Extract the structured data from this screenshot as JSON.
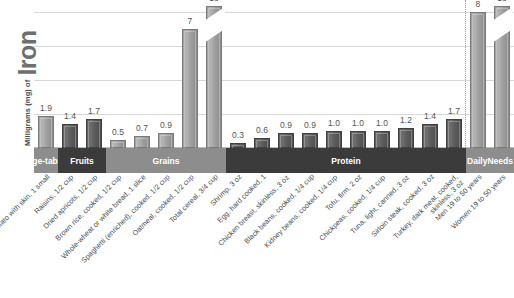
{
  "chart_data": {
    "type": "bar",
    "title": "",
    "ylabel_prefix": "Milligrams (mg) of",
    "ylabel_emphasis": "Iron",
    "xlabel": "",
    "ylim": [
      0,
      8.6
    ],
    "grid": true,
    "gridlines": [
      2,
      4,
      6,
      8
    ],
    "legend": "none",
    "categories": [
      "Baked potato with skin, 1 small",
      "Raisins, 1/2 cup",
      "Dried apricots, 1/2 cup",
      "Brown rice, cooked, 1/2 cup",
      "Whole-wheat or white bread, 1 slice",
      "Spaghetti (enriched), cooked, 1/2 cup",
      "Oatmeal, cooked, 1/2 cup",
      "Total cereal, 3/4 cup",
      "Shrimp, 3 oz",
      "Egg, hard cooked, 1",
      "Chicken breast, skinless, 3 oz",
      "Black beans, cooked, 1/4 cup",
      "Kidney beans, cooked, 1/4 cup",
      "Tofu, firm, 2 oz",
      "Chickpeas, cooked, 1/4 cup",
      "Tuna, light, canned, 3 oz",
      "Sirloin steak, cooked, 3 oz",
      "Turkey, dark meat, cooked, skinless, 3 oz",
      "Men 19 to 50 years",
      "Women 19 to 50 years"
    ],
    "values": [
      1.9,
      1.4,
      1.7,
      0.5,
      0.7,
      0.9,
      7,
      18,
      0.3,
      0.6,
      0.9,
      0.9,
      1.0,
      1.0,
      1.0,
      1.2,
      1.4,
      1.7,
      8,
      18
    ],
    "value_labels": [
      "1.9",
      "1.4",
      "1.7",
      "0.5",
      "0.7",
      "0.9",
      "7",
      "18",
      "0.3",
      "0.6",
      "0.9",
      "0.9",
      "1.0",
      "1.0",
      "1.0",
      "1.2",
      "1.4",
      "1.7",
      "8",
      "18"
    ],
    "broken_bars": [
      7,
      19
    ],
    "groups": [
      {
        "label": "Vege-\ntables",
        "shade": "light",
        "from": 0,
        "to": 0
      },
      {
        "label": "Fruits",
        "shade": "dark",
        "from": 1,
        "to": 2
      },
      {
        "label": "Grains",
        "shade": "light",
        "from": 3,
        "to": 7
      },
      {
        "label": "Protein",
        "shade": "dark",
        "from": 8,
        "to": 17
      },
      {
        "label": "Daily\nNeeds",
        "shade": "light",
        "from": 18,
        "to": 19
      }
    ]
  }
}
